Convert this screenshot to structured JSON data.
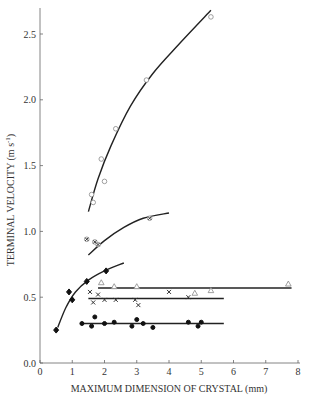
{
  "chart_data": {
    "type": "scatter",
    "title": "",
    "xlabel": "MAXIMUM DIMENSION OF CRYSTAL (mm)",
    "ylabel": "TERMINAL VELOCITY (m s-1)",
    "xlim": [
      0,
      8
    ],
    "ylim": [
      0,
      2.7
    ],
    "xticks": [
      "0",
      "1",
      "2",
      "3",
      "4",
      "5",
      "6",
      "7",
      "8"
    ],
    "yticks": [
      "0.0",
      "0.5",
      "1.0",
      "1.5",
      "2.0",
      "2.5"
    ],
    "grid": false,
    "legend": "none",
    "series": [
      {
        "name": "open circles (upper)",
        "marker": "circle-open",
        "points": [
          [
            1.6,
            1.28
          ],
          [
            1.65,
            1.22
          ],
          [
            1.9,
            1.55
          ],
          [
            2.0,
            1.38
          ],
          [
            2.35,
            1.78
          ],
          [
            3.3,
            2.15
          ],
          [
            5.3,
            2.63
          ]
        ],
        "fit_curve": [
          [
            1.5,
            1.15
          ],
          [
            1.8,
            1.4
          ],
          [
            2.2,
            1.65
          ],
          [
            2.8,
            1.95
          ],
          [
            3.5,
            2.2
          ],
          [
            4.3,
            2.42
          ],
          [
            5.3,
            2.68
          ]
        ]
      },
      {
        "name": "circled crosses",
        "marker": "circle-cross",
        "points": [
          [
            1.45,
            0.94
          ],
          [
            1.7,
            0.92
          ],
          [
            1.8,
            0.9
          ],
          [
            3.4,
            1.1
          ]
        ],
        "fit_curve": [
          [
            1.5,
            0.82
          ],
          [
            2.0,
            0.93
          ],
          [
            2.6,
            1.03
          ],
          [
            3.2,
            1.1
          ],
          [
            4.0,
            1.14
          ]
        ]
      },
      {
        "name": "filled diamonds",
        "marker": "diamond-filled",
        "points": [
          [
            0.5,
            0.25
          ],
          [
            0.9,
            0.54
          ],
          [
            1.0,
            0.48
          ],
          [
            1.45,
            0.62
          ],
          [
            2.05,
            0.7
          ]
        ],
        "fit_curve": [
          [
            0.55,
            0.27
          ],
          [
            0.8,
            0.42
          ],
          [
            1.1,
            0.54
          ],
          [
            1.5,
            0.63
          ],
          [
            2.0,
            0.7
          ],
          [
            2.6,
            0.76
          ]
        ]
      },
      {
        "name": "open triangles",
        "marker": "triangle-open",
        "points": [
          [
            1.9,
            0.61
          ],
          [
            2.3,
            0.58
          ],
          [
            3.0,
            0.58
          ],
          [
            4.8,
            0.53
          ],
          [
            5.3,
            0.55
          ],
          [
            7.7,
            0.6
          ]
        ],
        "fit_curve": [
          [
            1.8,
            0.57
          ],
          [
            7.8,
            0.57
          ]
        ]
      },
      {
        "name": "crosses",
        "marker": "x",
        "points": [
          [
            1.55,
            0.54
          ],
          [
            1.8,
            0.52
          ],
          [
            1.65,
            0.46
          ],
          [
            2.0,
            0.48
          ],
          [
            2.35,
            0.48
          ],
          [
            2.95,
            0.48
          ],
          [
            3.05,
            0.44
          ],
          [
            4.0,
            0.54
          ],
          [
            4.6,
            0.5
          ]
        ],
        "fit_curve": [
          [
            1.5,
            0.49
          ],
          [
            5.7,
            0.49
          ]
        ]
      },
      {
        "name": "filled circles",
        "marker": "circle-filled",
        "points": [
          [
            1.3,
            0.3
          ],
          [
            1.7,
            0.35
          ],
          [
            1.6,
            0.28
          ],
          [
            2.0,
            0.3
          ],
          [
            2.3,
            0.31
          ],
          [
            2.85,
            0.28
          ],
          [
            3.0,
            0.33
          ],
          [
            3.2,
            0.3
          ],
          [
            3.5,
            0.27
          ],
          [
            4.6,
            0.31
          ],
          [
            4.9,
            0.28
          ],
          [
            5.0,
            0.31
          ]
        ],
        "fit_curve": [
          [
            1.3,
            0.3
          ],
          [
            5.7,
            0.3
          ]
        ]
      }
    ]
  }
}
